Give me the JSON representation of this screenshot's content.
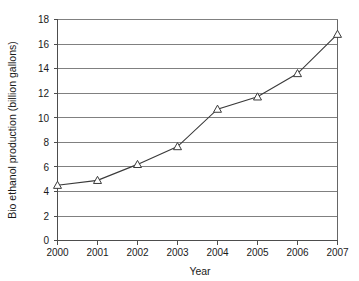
{
  "chart_data": {
    "type": "line",
    "title": "",
    "xlabel": "Year",
    "ylabel": "Bio ethanol production (billion gallons)",
    "categories": [
      "2000",
      "2001",
      "2002",
      "2003",
      "2004",
      "2005",
      "2006",
      "2007"
    ],
    "x": [
      2000,
      2001,
      2002,
      2003,
      2004,
      2005,
      2006,
      2007
    ],
    "values": [
      4.5,
      4.9,
      6.2,
      7.65,
      10.7,
      11.7,
      13.6,
      16.8
    ],
    "series": [
      {
        "name": "Bio ethanol production",
        "values": [
          4.5,
          4.9,
          6.2,
          7.65,
          10.7,
          11.7,
          13.6,
          16.8
        ]
      }
    ],
    "ylim": [
      0,
      18
    ],
    "ytick_step": 2,
    "yticks": [
      0,
      2,
      4,
      6,
      8,
      10,
      12,
      14,
      16,
      18
    ],
    "ytick_labels": [
      "0",
      "2",
      "4",
      "6",
      "8",
      "10",
      "12",
      "14",
      "16",
      "18"
    ],
    "xtick_labels": [
      "2000",
      "2001",
      "2002",
      "2003",
      "2004",
      "2005",
      "2006",
      "2007"
    ],
    "grid": "horizontal",
    "legend": "none",
    "marker": "triangle-open",
    "colors": {
      "line": "#3a3a3a",
      "marker_fill": "#ffffff",
      "marker_stroke": "#3a3a3a",
      "grid": "#808080",
      "axis": "#4d4d4d",
      "text": "#1a1a1a",
      "background": "#ffffff"
    }
  }
}
